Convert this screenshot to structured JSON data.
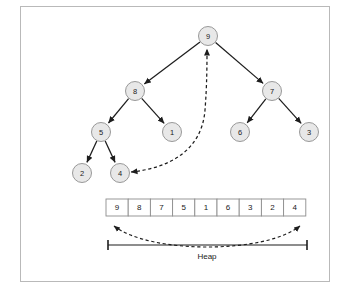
{
  "figure": {
    "title_label": "Heap",
    "colors": {
      "node_fill": "#e8e8e8",
      "node_stroke": "#8d8d8d",
      "edge": "#1d1d1d",
      "frame": "#b9b9b9",
      "background": "#ffffff",
      "cell_fill": "#ffffff",
      "cell_stroke": "#8d8d8d"
    },
    "tree": {
      "nodes": [
        {
          "id": "n0",
          "label": "9",
          "cx": 208,
          "cy": 36,
          "r": 9.5
        },
        {
          "id": "n1",
          "label": "8",
          "cx": 135,
          "cy": 91,
          "r": 9.5
        },
        {
          "id": "n2",
          "label": "7",
          "cx": 272,
          "cy": 91,
          "r": 9.5
        },
        {
          "id": "n3",
          "label": "5",
          "cx": 101,
          "cy": 132,
          "r": 9.5
        },
        {
          "id": "n4",
          "label": "1",
          "cx": 172,
          "cy": 132,
          "r": 9.5
        },
        {
          "id": "n5",
          "label": "6",
          "cx": 240,
          "cy": 132,
          "r": 9.5
        },
        {
          "id": "n6",
          "label": "3",
          "cx": 309,
          "cy": 132,
          "r": 9.5
        },
        {
          "id": "n7",
          "label": "2",
          "cx": 82,
          "cy": 173,
          "r": 9.5
        },
        {
          "id": "n8",
          "label": "4",
          "cx": 120,
          "cy": 173,
          "r": 9.5
        }
      ],
      "edges": [
        {
          "from": "n0",
          "to": "n1"
        },
        {
          "from": "n0",
          "to": "n2"
        },
        {
          "from": "n1",
          "to": "n3"
        },
        {
          "from": "n1",
          "to": "n4"
        },
        {
          "from": "n2",
          "to": "n5"
        },
        {
          "from": "n2",
          "to": "n6"
        },
        {
          "from": "n3",
          "to": "n7"
        },
        {
          "from": "n3",
          "to": "n8"
        }
      ],
      "swap_arrow": {
        "label": "swap-root-with-last",
        "path": "M 131 172 C 170 168 202 150 205 110 C 207 85 207 62 207 49"
      }
    },
    "array": {
      "values": [
        "9",
        "8",
        "7",
        "5",
        "1",
        "6",
        "3",
        "2",
        "4"
      ],
      "x": 106,
      "y": 199,
      "cell_width": 22.2,
      "cell_height": 17
    },
    "range_marker": {
      "label": "Heap",
      "curve_path": "M 114 226 C 150 254 265 254 300 226",
      "line_x1": 108,
      "line_x2": 307,
      "line_y": 245,
      "label_x": 207,
      "label_y": 256
    }
  }
}
